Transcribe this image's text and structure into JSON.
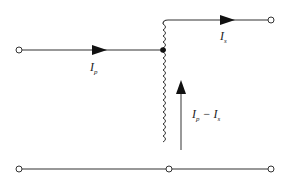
{
  "diagram": {
    "type": "autotransformer-current-diagram",
    "labels": {
      "primary_current": {
        "main": "I",
        "sub": "p"
      },
      "secondary_current": {
        "main": "I",
        "sub": "s"
      },
      "winding_current": {
        "a_main": "I",
        "a_sub": "p",
        "op": " − ",
        "b_main": "I",
        "b_sub": "s"
      }
    },
    "colors": {
      "wire": "#333333",
      "arrow": "#111111",
      "winding_arrow": "#777777"
    }
  }
}
